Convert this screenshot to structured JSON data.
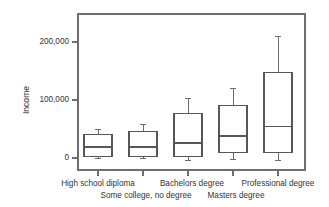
{
  "chart_data": {
    "type": "box",
    "title": "",
    "xlabel": "",
    "ylabel": "Income",
    "ylim": [
      -22000,
      242000
    ],
    "grid": false,
    "legend": false,
    "ytick_values": [
      0,
      100000,
      200000
    ],
    "ytick_labels": [
      "0",
      "100,000",
      "200,000"
    ],
    "categories": [
      "High school diploma",
      "Some college, no degree",
      "Bachelors degree",
      "Masters degree",
      "Professional degree"
    ],
    "category_label_rows": [
      0,
      1,
      0,
      1,
      0
    ],
    "boxes": [
      {
        "category": "High school diploma",
        "whisker_low": 0,
        "q1": 2000,
        "median": 19000,
        "q3": 40000,
        "whisker_high": 50000
      },
      {
        "category": "Some college, no degree",
        "whisker_low": 0,
        "q1": 2000,
        "median": 19000,
        "q3": 45000,
        "whisker_high": 57000
      },
      {
        "category": "Bachelors degree",
        "whisker_low": -5000,
        "q1": 3000,
        "median": 26000,
        "q3": 76000,
        "whisker_high": 102000
      },
      {
        "category": "Masters degree",
        "whisker_low": -3000,
        "q1": 10000,
        "median": 38000,
        "q3": 91000,
        "whisker_high": 119000
      },
      {
        "category": "Professional degree",
        "whisker_low": -5000,
        "q1": 10000,
        "median": 55000,
        "q3": 147000,
        "whisker_high": 209000
      }
    ]
  },
  "axes": {
    "y_title": "Income",
    "tick_labels_y": [
      "200,000",
      "100,000",
      "0"
    ],
    "tick_labels_x_row1": [
      "High school diploma",
      "Bachelors degree",
      "Professional degree"
    ],
    "tick_labels_x_row2": [
      "Some college, no degree",
      "Masters degree"
    ]
  },
  "colors": {
    "frame": "#6e6e6e",
    "box_stroke": "#575757",
    "whisker": "#6b6b6b",
    "text": "#333333",
    "background": "#ffffff"
  }
}
